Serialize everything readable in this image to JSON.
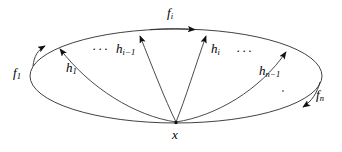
{
  "figure": {
    "name": "loop-space-diagram",
    "background_color": "#ffffff",
    "stroke_color": "#1a1a1a",
    "vertex": {
      "label": "x",
      "x": 176,
      "y": 123
    },
    "ellipse": {
      "cx": 176,
      "cy": 76,
      "rx": 146,
      "ry": 47
    },
    "boundary_labels": [
      {
        "id": "f-1",
        "base": "f",
        "sub": "1",
        "x": 13,
        "y": 66
      },
      {
        "id": "f-i",
        "base": "f",
        "sub": "i",
        "x": 167,
        "y": 6
      },
      {
        "id": "f-n",
        "base": "f",
        "sub": "n",
        "x": 316,
        "y": 88
      }
    ],
    "interior_labels": [
      {
        "id": "h-1",
        "base": "h",
        "sub": "1",
        "x": 66,
        "y": 61
      },
      {
        "id": "h-i-1",
        "base": "h",
        "sub": "i−1",
        "x": 116,
        "y": 42
      },
      {
        "id": "h-i",
        "base": "h",
        "sub": "i",
        "x": 211,
        "y": 42
      },
      {
        "id": "h-n-1",
        "base": "h",
        "sub": "n−1",
        "x": 259,
        "y": 64
      }
    ],
    "ellipsis_marks": [
      {
        "id": "ellipsis-left",
        "glyph": "···",
        "x": 92,
        "y": 42
      },
      {
        "id": "ellipsis-right",
        "glyph": "···",
        "x": 236,
        "y": 44
      }
    ],
    "accent_dot": {
      "id": "accent-dot",
      "x": 282,
      "y": 90
    }
  }
}
